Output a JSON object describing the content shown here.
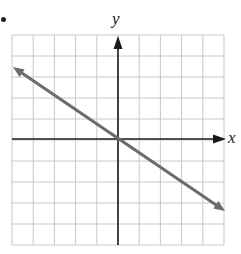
{
  "bullet": "•",
  "chart_data": {
    "type": "line",
    "title": "",
    "xlabel": "x",
    "ylabel": "y",
    "xlim": [
      -5,
      5
    ],
    "ylim": [
      -5,
      5
    ],
    "grid": true,
    "ticks_labeled": false,
    "legend": null,
    "series": [
      {
        "name": "line",
        "equation": "y = -2/3 x",
        "x": [
          -5,
          5
        ],
        "y": [
          3.33,
          -3.33
        ],
        "arrows_both_ends": true,
        "color": "#6b6b6b"
      }
    ]
  },
  "colors": {
    "grid": "#c8c8c8",
    "axes": "#1a1a1a",
    "line": "#6b6b6b"
  }
}
